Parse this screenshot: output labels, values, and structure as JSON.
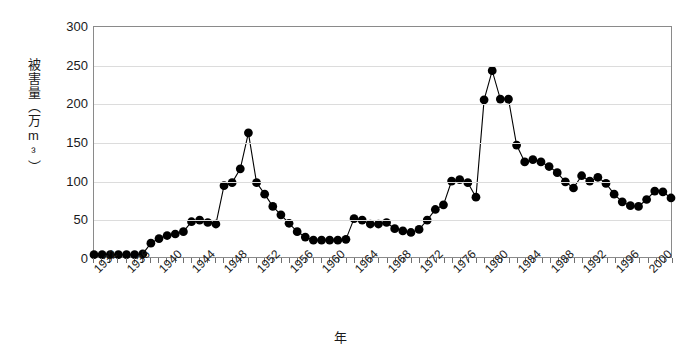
{
  "chart_data": {
    "type": "line",
    "title": "",
    "subtitle": "",
    "xlabel": "年",
    "ylabel": "被害量（万m³）",
    "ylabel_chars": [
      "被",
      "害",
      "量",
      "（",
      "万",
      "m³",
      "）"
    ],
    "xlim": [
      1932,
      2003
    ],
    "ylim": [
      0,
      300
    ],
    "yticks": [
      0,
      50,
      100,
      150,
      200,
      250,
      300
    ],
    "xticks": [
      1932,
      1936,
      1940,
      1944,
      1948,
      1952,
      1956,
      1960,
      1964,
      1968,
      1972,
      1976,
      1980,
      1984,
      1988,
      1992,
      1996,
      2000
    ],
    "grid": "horizontal",
    "legend": "none",
    "marker": "filled-circle",
    "marker_color": "#000000",
    "line_color": "#000000",
    "x": [
      1932,
      1933,
      1934,
      1935,
      1936,
      1937,
      1938,
      1939,
      1940,
      1941,
      1942,
      1943,
      1944,
      1945,
      1946,
      1947,
      1948,
      1949,
      1950,
      1951,
      1952,
      1953,
      1954,
      1955,
      1956,
      1957,
      1958,
      1959,
      1960,
      1961,
      1962,
      1963,
      1964,
      1965,
      1966,
      1967,
      1968,
      1969,
      1970,
      1971,
      1972,
      1973,
      1974,
      1975,
      1976,
      1977,
      1978,
      1979,
      1980,
      1981,
      1982,
      1983,
      1984,
      1985,
      1986,
      1987,
      1988,
      1989,
      1990,
      1991,
      1992,
      1993,
      1994,
      1995,
      1996,
      1997,
      1998,
      1999,
      2000,
      2001,
      2002,
      2003
    ],
    "values": [
      3,
      3,
      3,
      3,
      3,
      3,
      4,
      18,
      24,
      28,
      30,
      33,
      46,
      48,
      45,
      43,
      93,
      97,
      115,
      162,
      97,
      82,
      66,
      55,
      44,
      33,
      26,
      22,
      22,
      22,
      22,
      23,
      50,
      48,
      43,
      43,
      45,
      37,
      34,
      32,
      36,
      48,
      62,
      68,
      99,
      101,
      97,
      78,
      205,
      243,
      206,
      206,
      146,
      124,
      127,
      124,
      118,
      110,
      98,
      90,
      106,
      99,
      104,
      96,
      82,
      72,
      67,
      66,
      75,
      86,
      85,
      77
    ],
    "series": [
      {
        "name": "被害量",
        "values": [
          3,
          3,
          3,
          3,
          3,
          3,
          4,
          18,
          24,
          28,
          30,
          33,
          46,
          48,
          45,
          43,
          93,
          97,
          115,
          162,
          97,
          82,
          66,
          55,
          44,
          33,
          26,
          22,
          22,
          22,
          22,
          23,
          50,
          48,
          43,
          43,
          45,
          37,
          34,
          32,
          36,
          48,
          62,
          68,
          99,
          101,
          97,
          78,
          205,
          243,
          206,
          206,
          146,
          124,
          127,
          124,
          118,
          110,
          98,
          90,
          106,
          99,
          104,
          96,
          82,
          72,
          67,
          66,
          75,
          86,
          85,
          77
        ]
      }
    ],
    "annotations": []
  },
  "axis": {
    "y_tick_labels": [
      "300",
      "250",
      "200",
      "150",
      "100",
      "50",
      "0"
    ],
    "x_tick_labels": [
      "1932",
      "1936",
      "1940",
      "1944",
      "1948",
      "1952",
      "1956",
      "1960",
      "1964",
      "1968",
      "1972",
      "1976",
      "1980",
      "1984",
      "1988",
      "1992",
      "1996",
      "2000"
    ]
  },
  "colors": {
    "line": "#000000",
    "marker": "#000000",
    "grid": "#dcdcdc",
    "border": "#8a8a8a",
    "background": "#ffffff",
    "text": "#1a1a1a"
  }
}
